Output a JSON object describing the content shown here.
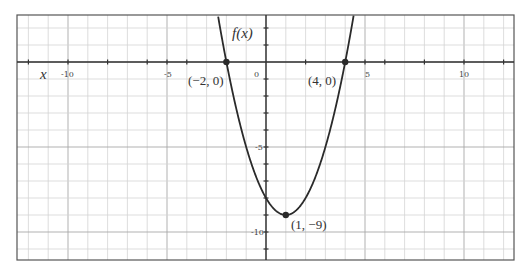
{
  "chart_data": {
    "type": "line",
    "title": "",
    "function": "f(x) = (x - 1)^2 - 9",
    "xlabel": "x",
    "ylabel": "f(x)",
    "xlim": [
      -12.6,
      12.5
    ],
    "ylim": [
      -11.6,
      2.76
    ],
    "grid": true,
    "x_ticks": [
      {
        "value": -10,
        "label": "-10"
      },
      {
        "value": -5,
        "label": "-5"
      },
      {
        "value": 0,
        "label": "0"
      },
      {
        "value": 5,
        "label": "5"
      },
      {
        "value": 10,
        "label": "10"
      }
    ],
    "y_ticks": [
      {
        "value": -5,
        "label": "-5"
      },
      {
        "value": -10,
        "label": "-10"
      }
    ],
    "series": [
      {
        "name": "f(x)",
        "x": [
          -2.43,
          -2,
          -1,
          0,
          1,
          2,
          3,
          4,
          4.43
        ],
        "y": [
          2.76,
          0,
          -5,
          -8,
          -9,
          -8,
          -5,
          0,
          2.76
        ]
      }
    ],
    "annotations": [
      {
        "label": "(−2, 0)",
        "x": -2,
        "y": 0
      },
      {
        "label": "(4, 0)",
        "x": 4,
        "y": 0
      },
      {
        "label": "(1, −9)",
        "x": 1,
        "y": -9
      }
    ],
    "legend": null
  },
  "labels": {
    "x_axis": "x",
    "y_axis": "f(x)",
    "x_tick_neg10": "-10",
    "x_tick_neg5": "-5",
    "x_tick_0": "0",
    "x_tick_5": "5",
    "x_tick_10": "10",
    "y_tick_neg5": "-5",
    "y_tick_neg10": "-10",
    "point_left_root": "(−2, 0)",
    "point_right_root": "(4, 0)",
    "point_vertex": "(1, −9)"
  }
}
